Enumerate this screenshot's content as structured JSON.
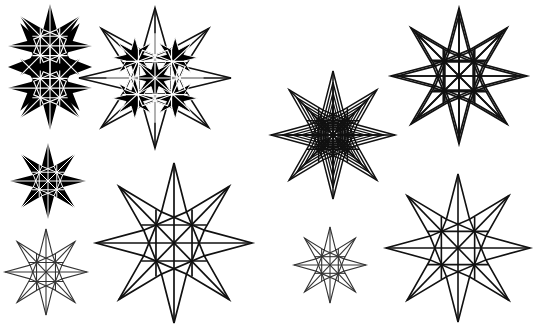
{
  "canvas": {
    "width": 541,
    "height": 326,
    "background": "#ffffff",
    "stroke": "#111111",
    "fill": "#000000",
    "title": "Eight-pointed star figure plate"
  },
  "chart_data": {
    "type": "scatter",
    "xlabel": "",
    "ylabel": "",
    "xlim": [
      0,
      541
    ],
    "ylim": [
      0,
      326
    ],
    "grid": false,
    "legend": "none",
    "annotations": [],
    "categories": [
      "tall-filled-star",
      "outlined-star-filled-core",
      "small-filled-star",
      "large-thin-star",
      "small-thin-star",
      "nested-multi-scale-star",
      "small-center-star",
      "doubled-line-star",
      "bottom-right-star"
    ],
    "values": [
      9,
      9,
      8,
      8,
      8,
      8,
      8,
      8,
      8
    ],
    "series": [
      {
        "name": "center-x",
        "values": [
          50,
          155,
          48,
          174,
          46,
          333,
          330,
          459,
          458
        ]
      },
      {
        "name": "center-y",
        "values": [
          67,
          78,
          181,
          243,
          272,
          135,
          265,
          76,
          248
        ]
      },
      {
        "name": "outer-radius",
        "values": [
          46,
          78,
          40,
          78,
          42,
          68,
          36,
          72,
          72
        ]
      }
    ]
  },
  "figures": [
    {
      "id": "fig-1",
      "name": "tall-filled-star",
      "label": "Filled 8-point star, vertically elongated",
      "cx": 50,
      "cy": 67,
      "outer_rx": 42,
      "outer_ry": 62,
      "inner_ratio": 0.42,
      "style": "filled",
      "fill": "#000000",
      "stroke": "#ffffff",
      "stroke_width": 1.1,
      "points": 8,
      "rotation": 0,
      "scales": [
        1.0
      ],
      "grid_lines": true
    },
    {
      "id": "fig-2",
      "name": "outlined-star-filled-core",
      "label": "Large outlined 8-point star with dense filled core",
      "cx": 155,
      "cy": 78,
      "outer_rx": 76,
      "outer_ry": 70,
      "inner_ratio": 0.42,
      "style": "outline-with-core",
      "fill": "none",
      "stroke": "#111111",
      "stroke_width": 1.6,
      "points": 8,
      "rotation": 0,
      "scales": [
        1.0,
        0.33
      ],
      "grid_lines": true
    },
    {
      "id": "fig-3",
      "name": "small-filled-star",
      "label": "Small filled 8-point star",
      "cx": 48,
      "cy": 181,
      "outer_rx": 38,
      "outer_ry": 38,
      "inner_ratio": 0.42,
      "style": "filled",
      "fill": "#000000",
      "stroke": "#ffffff",
      "stroke_width": 1.0,
      "points": 8,
      "rotation": 0,
      "scales": [
        1.0
      ],
      "grid_lines": true
    },
    {
      "id": "fig-4",
      "name": "large-thin-star",
      "label": "Large thin-line 8-point star",
      "cx": 174,
      "cy": 243,
      "outer_rx": 78,
      "outer_ry": 80,
      "inner_ratio": 0.42,
      "style": "outline",
      "fill": "none",
      "stroke": "#111111",
      "stroke_width": 1.7,
      "points": 8,
      "rotation": 0,
      "scales": [
        1.0
      ],
      "grid_lines": true
    },
    {
      "id": "fig-5",
      "name": "small-thin-star",
      "label": "Small thin-line 8-point star",
      "cx": 46,
      "cy": 272,
      "outer_rx": 41,
      "outer_ry": 43,
      "inner_ratio": 0.42,
      "style": "outline",
      "fill": "none",
      "stroke": "#333333",
      "stroke_width": 1.1,
      "points": 8,
      "rotation": 0,
      "scales": [
        1.0
      ],
      "grid_lines": true
    },
    {
      "id": "fig-6",
      "name": "nested-multi-scale-star",
      "label": "Nested multi-scale 8-point star cluster",
      "cx": 333,
      "cy": 135,
      "outer_rx": 62,
      "outer_ry": 64,
      "inner_ratio": 0.42,
      "style": "nested",
      "fill": "none",
      "stroke": "#111111",
      "stroke_width": 1.5,
      "points": 8,
      "rotation": 0,
      "scales": [
        1.0,
        0.82,
        0.66,
        0.52,
        0.4,
        0.3
      ],
      "grid_lines": true
    },
    {
      "id": "fig-7",
      "name": "small-center-star",
      "label": "Small centre 8-point star",
      "cx": 330,
      "cy": 265,
      "outer_rx": 36,
      "outer_ry": 38,
      "inner_ratio": 0.42,
      "style": "outline",
      "fill": "none",
      "stroke": "#333333",
      "stroke_width": 1.1,
      "points": 8,
      "rotation": 0,
      "scales": [
        1.0
      ],
      "grid_lines": true
    },
    {
      "id": "fig-8",
      "name": "doubled-line-star",
      "label": "8-point star with doubled parallel strokes",
      "cx": 459,
      "cy": 76,
      "outer_rx": 68,
      "outer_ry": 68,
      "inner_ratio": 0.42,
      "style": "doubled",
      "fill": "none",
      "stroke": "#111111",
      "stroke_width": 1.7,
      "points": 8,
      "rotation": 0,
      "scales": [
        1.0,
        0.9
      ],
      "grid_lines": true
    },
    {
      "id": "fig-9",
      "name": "bottom-right-star",
      "label": "Bottom-right thin-line 8-point star",
      "cx": 458,
      "cy": 248,
      "outer_rx": 72,
      "outer_ry": 74,
      "inner_ratio": 0.42,
      "style": "outline",
      "fill": "none",
      "stroke": "#111111",
      "stroke_width": 1.6,
      "points": 8,
      "rotation": 0,
      "scales": [
        1.0
      ],
      "grid_lines": true
    }
  ]
}
